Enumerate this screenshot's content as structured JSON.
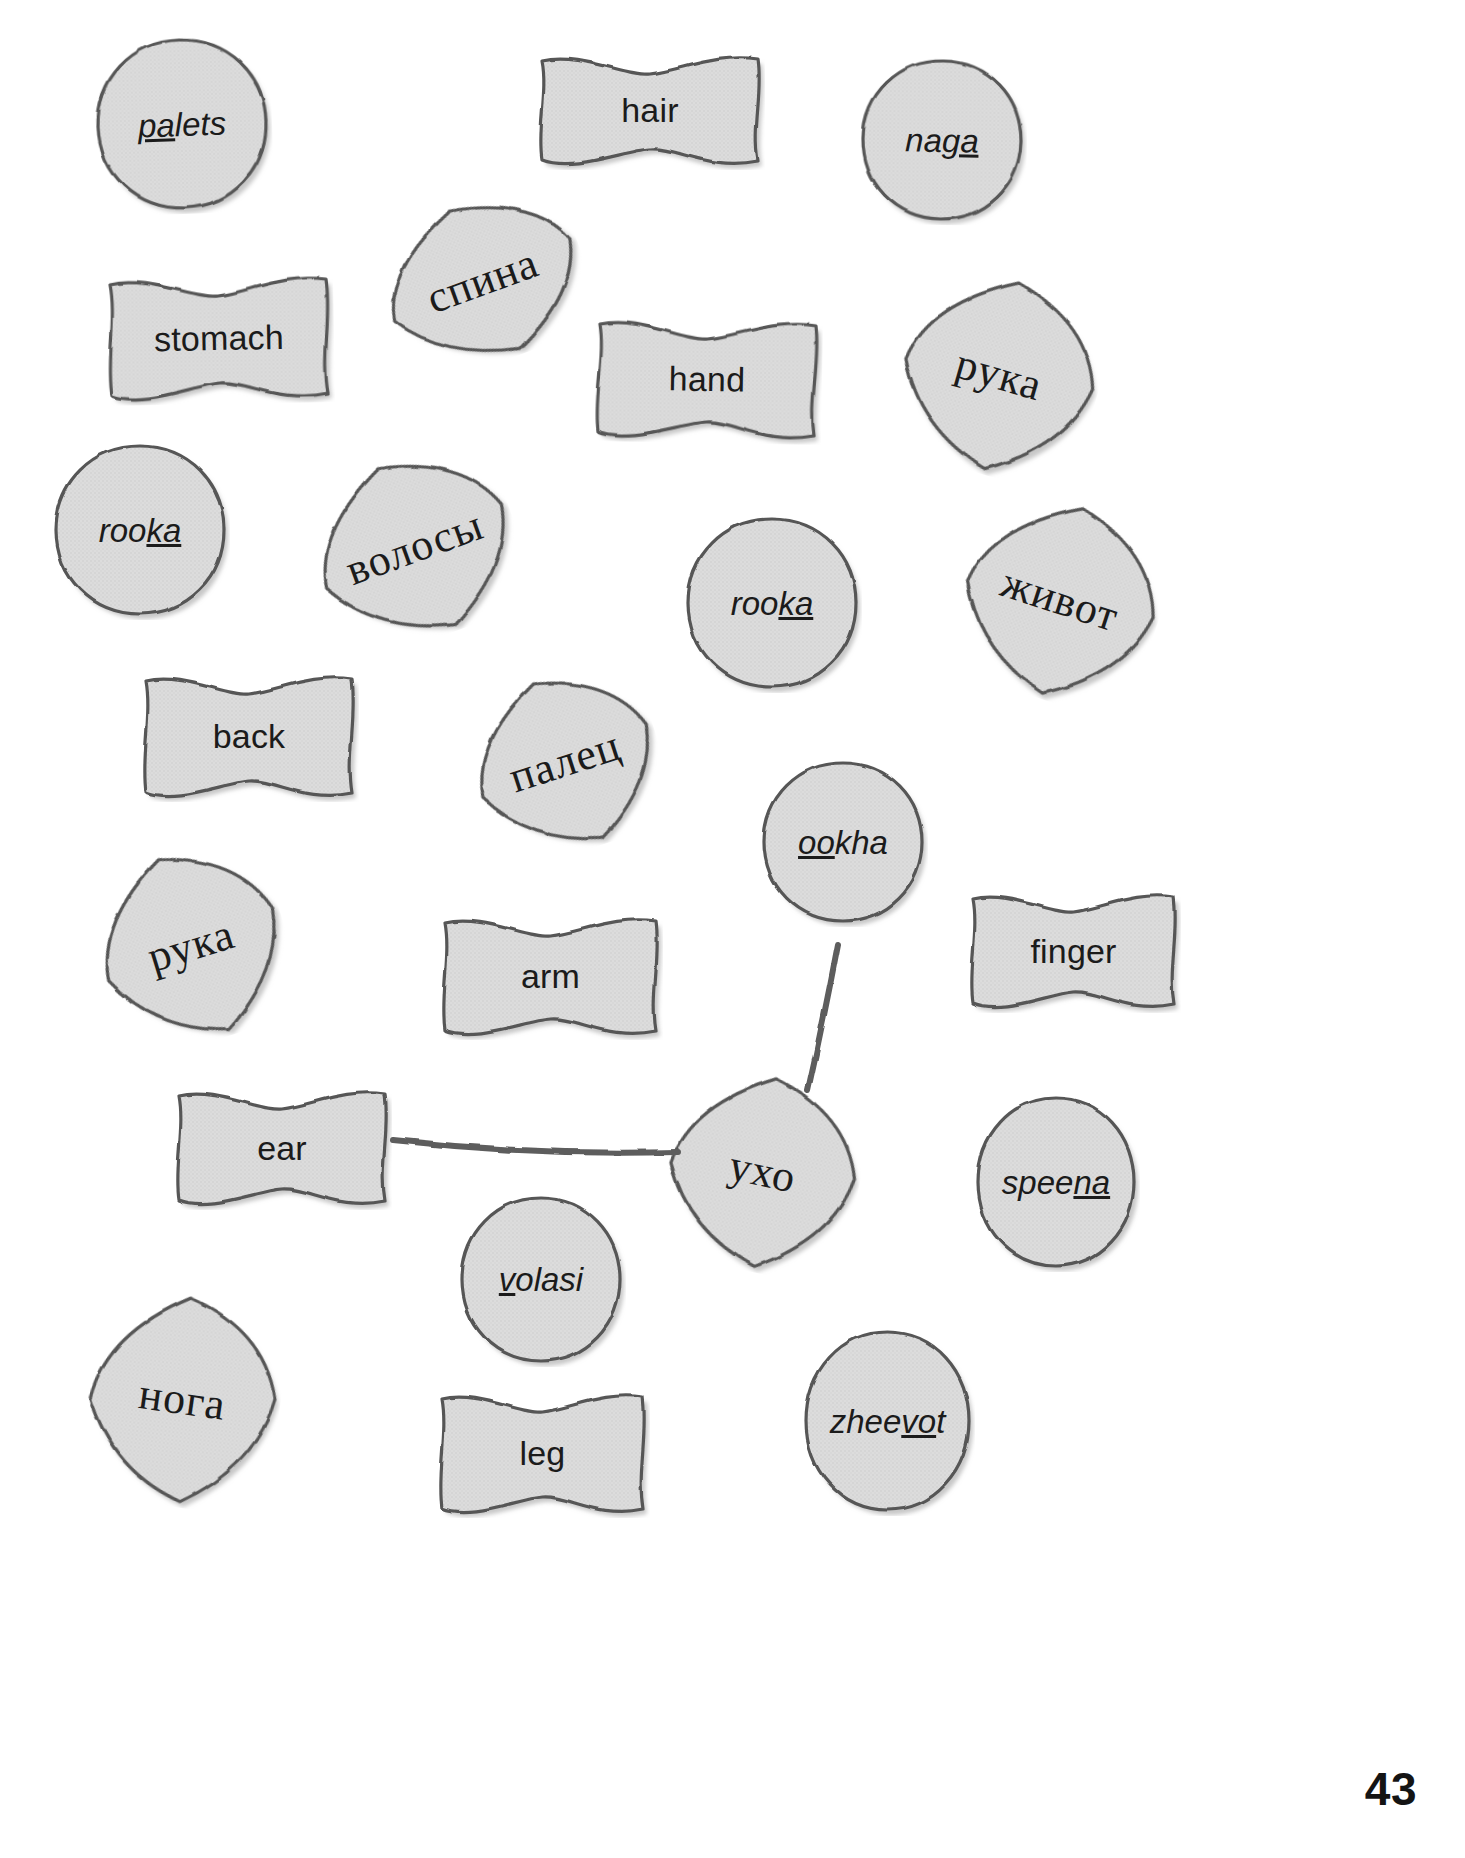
{
  "page": {
    "number": "43",
    "shape_fill": "#dcdcdc",
    "shape_stroke": "#565656",
    "connector_color": "#5d5d5d",
    "background": "#ffffff"
  },
  "cards": [
    {
      "id": "palets",
      "text": "palets",
      "kind": "translit",
      "shape": "circle",
      "stress_start": 0,
      "stress_end": 2,
      "x": 92,
      "y": 34,
      "w": 180,
      "h": 180,
      "rot": -2
    },
    {
      "id": "hair",
      "text": "hair",
      "kind": "english",
      "shape": "banner",
      "x": 535,
      "y": 50,
      "w": 230,
      "h": 120,
      "rot": 0
    },
    {
      "id": "naga",
      "text": "naga",
      "kind": "translit",
      "shape": "circle",
      "stress_start": 2,
      "stress_end": 4,
      "x": 857,
      "y": 55,
      "w": 170,
      "h": 170,
      "rot": 1
    },
    {
      "id": "stomach",
      "text": "stomach",
      "kind": "english",
      "shape": "banner",
      "x": 104,
      "y": 272,
      "w": 230,
      "h": 132,
      "rot": -1
    },
    {
      "id": "spina",
      "text": "спина",
      "kind": "russian",
      "shape": "quad",
      "x": 380,
      "y": 198,
      "w": 205,
      "h": 165,
      "rot": -20
    },
    {
      "id": "hand",
      "text": "hand",
      "kind": "english",
      "shape": "banner",
      "x": 592,
      "y": 315,
      "w": 230,
      "h": 128,
      "rot": 1
    },
    {
      "id": "ruka-1",
      "text": "рука",
      "kind": "russian",
      "shape": "quad",
      "x": 899,
      "y": 275,
      "w": 200,
      "h": 200,
      "rot": 16
    },
    {
      "id": "rooka-1",
      "text": "rooka",
      "kind": "translit",
      "shape": "circle",
      "stress_start": 3,
      "stress_end": 5,
      "x": 50,
      "y": 440,
      "w": 180,
      "h": 180,
      "rot": 0
    },
    {
      "id": "volosy",
      "text": "волосы",
      "kind": "russian",
      "shape": "quad",
      "x": 312,
      "y": 455,
      "w": 205,
      "h": 185,
      "rot": -20
    },
    {
      "id": "rooka-2",
      "text": "rooka",
      "kind": "translit",
      "shape": "circle",
      "stress_start": 3,
      "stress_end": 5,
      "x": 682,
      "y": 513,
      "w": 180,
      "h": 180,
      "rot": 0
    },
    {
      "id": "zhivot",
      "text": "живот",
      "kind": "russian",
      "shape": "quad",
      "x": 960,
      "y": 500,
      "w": 200,
      "h": 200,
      "rot": 18
    },
    {
      "id": "back",
      "text": "back",
      "kind": "english",
      "shape": "banner",
      "x": 139,
      "y": 670,
      "w": 220,
      "h": 132,
      "rot": 0
    },
    {
      "id": "palec",
      "text": "палец",
      "kind": "russian",
      "shape": "quad",
      "x": 470,
      "y": 672,
      "w": 190,
      "h": 180,
      "rot": -18
    },
    {
      "id": "ookha",
      "text": "ookha",
      "kind": "translit",
      "shape": "circle",
      "stress_start": 0,
      "stress_end": 2,
      "x": 758,
      "y": 757,
      "w": 170,
      "h": 170,
      "rot": 0
    },
    {
      "id": "ruka-2",
      "text": "рука",
      "kind": "russian",
      "shape": "quad",
      "x": 96,
      "y": 848,
      "w": 190,
      "h": 195,
      "rot": -17
    },
    {
      "id": "arm",
      "text": "arm",
      "kind": "english",
      "shape": "banner",
      "x": 438,
      "y": 912,
      "w": 225,
      "h": 128,
      "rot": 0
    },
    {
      "id": "finger",
      "text": "finger",
      "kind": "english",
      "shape": "banner",
      "x": 966,
      "y": 888,
      "w": 215,
      "h": 125,
      "rot": 0
    },
    {
      "id": "ear",
      "text": "ear",
      "kind": "english",
      "shape": "banner",
      "x": 172,
      "y": 1085,
      "w": 220,
      "h": 125,
      "rot": 0
    },
    {
      "id": "ukho",
      "text": "ухо",
      "kind": "russian",
      "shape": "quad",
      "x": 665,
      "y": 1072,
      "w": 195,
      "h": 200,
      "rot": 12
    },
    {
      "id": "speena",
      "text": "speena",
      "kind": "translit",
      "shape": "circle",
      "stress_start": 4,
      "stress_end": 6,
      "x": 972,
      "y": 1092,
      "w": 168,
      "h": 180,
      "rot": 0
    },
    {
      "id": "volasi",
      "text": "volasi",
      "kind": "translit",
      "shape": "circle",
      "stress_start": 0,
      "stress_end": 1,
      "x": 456,
      "y": 1192,
      "w": 170,
      "h": 175,
      "rot": 0
    },
    {
      "id": "noga",
      "text": "нога",
      "kind": "russian",
      "shape": "quad",
      "x": 85,
      "y": 1292,
      "w": 195,
      "h": 215,
      "rot": 8
    },
    {
      "id": "zheevot",
      "text": "zheevot",
      "kind": "translit",
      "shape": "circle",
      "stress_start": 4,
      "stress_end": 6,
      "x": 800,
      "y": 1326,
      "w": 175,
      "h": 190,
      "rot": 0
    },
    {
      "id": "leg",
      "text": "leg",
      "kind": "english",
      "shape": "banner",
      "x": 435,
      "y": 1388,
      "w": 215,
      "h": 130,
      "rot": 0
    }
  ],
  "connectors": [
    {
      "id": "ear-to-ukho",
      "from": "ear",
      "to": "ukho",
      "x1": 393,
      "y1": 1140,
      "x2": 678,
      "y2": 1152
    },
    {
      "id": "ookha-to-ukho",
      "from": "ookha",
      "to": "ukho",
      "x1": 838,
      "y1": 944,
      "x2": 808,
      "y2": 1090
    }
  ]
}
